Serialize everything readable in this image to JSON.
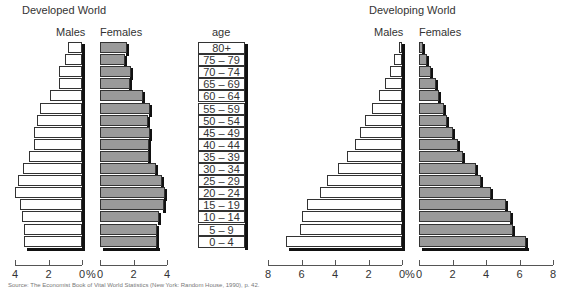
{
  "chart_data": [
    {
      "type": "bar",
      "orientation": "horizontal",
      "subtype": "population-pyramid",
      "title": "Developed World",
      "xlabel": "%",
      "categories": [
        "80+",
        "75 – 79",
        "70 – 74",
        "65 – 69",
        "60 – 64",
        "55 – 59",
        "50 – 54",
        "45 – 49",
        "40 – 44",
        "35 – 39",
        "30 – 34",
        "25 – 29",
        "20 – 24",
        "15 – 19",
        "10 – 14",
        "5 – 9",
        "0 – 4"
      ],
      "series": [
        {
          "name": "Males",
          "color": "#ffffff",
          "values": [
            0.85,
            1.0,
            1.4,
            1.4,
            1.9,
            2.5,
            2.7,
            2.85,
            2.85,
            3.15,
            3.5,
            3.8,
            4.0,
            3.7,
            3.6,
            3.45,
            3.45
          ]
        },
        {
          "name": "Females",
          "color": "#9a9a9a",
          "values": [
            1.6,
            1.5,
            1.85,
            1.8,
            2.55,
            3.0,
            2.85,
            3.0,
            2.9,
            2.9,
            3.35,
            3.7,
            3.9,
            3.85,
            3.5,
            3.4,
            3.4
          ]
        }
      ],
      "male_ticks": [
        "4",
        "2",
        "0"
      ],
      "female_ticks": [
        "0",
        "2",
        "4"
      ],
      "xlim": [
        0,
        4
      ],
      "grid": false
    },
    {
      "type": "bar",
      "orientation": "horizontal",
      "subtype": "population-pyramid",
      "title": "Developing World",
      "xlabel": "%",
      "categories": [
        "80+",
        "75 – 79",
        "70 – 74",
        "65 – 69",
        "60 – 64",
        "55 – 59",
        "50 – 54",
        "45 – 49",
        "40 – 44",
        "35 – 39",
        "30 – 34",
        "25 – 29",
        "20 – 24",
        "15 – 19",
        "10 – 14",
        "5 – 9",
        "0 – 4"
      ],
      "series": [
        {
          "name": "Males",
          "color": "#ffffff",
          "values": [
            0.2,
            0.45,
            0.7,
            1.0,
            1.35,
            1.8,
            2.2,
            2.5,
            2.8,
            3.3,
            3.8,
            4.5,
            4.9,
            5.7,
            6.0,
            6.1,
            6.9
          ]
        },
        {
          "name": "Females",
          "color": "#9a9a9a",
          "values": [
            0.25,
            0.5,
            0.7,
            1.0,
            1.2,
            1.5,
            1.7,
            2.0,
            2.3,
            2.6,
            3.4,
            3.7,
            4.3,
            5.2,
            5.5,
            5.6,
            6.4
          ]
        }
      ],
      "male_ticks": [
        "8",
        "6",
        "4",
        "2",
        "0"
      ],
      "female_ticks": [
        "0",
        "2",
        "4",
        "6",
        "8"
      ],
      "xlim": [
        0,
        8
      ],
      "grid": false
    }
  ],
  "labels": {
    "developed_title": "Developed World",
    "developing_title": "Developing World",
    "males": "Males",
    "females": "Females",
    "age_header": "age",
    "percent": "%"
  },
  "source": "Source: The Economist Book of Vital World Statistics (New York: Random House, 1990), p. 42."
}
